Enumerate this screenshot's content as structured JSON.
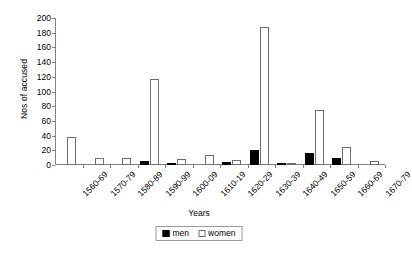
{
  "chart_data": {
    "type": "bar",
    "title": "",
    "xlabel": "Years",
    "ylabel": "Nos of accused",
    "ylim": [
      0,
      200
    ],
    "yticks": [
      0,
      20,
      40,
      60,
      80,
      100,
      120,
      140,
      160,
      180,
      200
    ],
    "grid": false,
    "legend_position": "bottom-center",
    "categories": [
      "1560-69",
      "1570-79",
      "1580-89",
      "1590-99",
      "1600-09",
      "1610-19",
      "1620-29",
      "1630-39",
      "1640-49",
      "1650-59",
      "1660-69",
      "1670-79"
    ],
    "series": [
      {
        "name": "men",
        "color": "#000000",
        "values": [
          0,
          0,
          0,
          6,
          1,
          0,
          4,
          20,
          1,
          17,
          10,
          0
        ]
      },
      {
        "name": "women",
        "color": "#ffffff",
        "values": [
          38,
          10,
          10,
          117,
          8,
          14,
          7,
          188,
          2,
          75,
          25,
          5
        ]
      }
    ]
  },
  "legend": {
    "items": [
      {
        "label": "men"
      },
      {
        "label": "women"
      }
    ]
  },
  "axes": {
    "y_title": "Nos of accused",
    "x_title": "Years"
  }
}
